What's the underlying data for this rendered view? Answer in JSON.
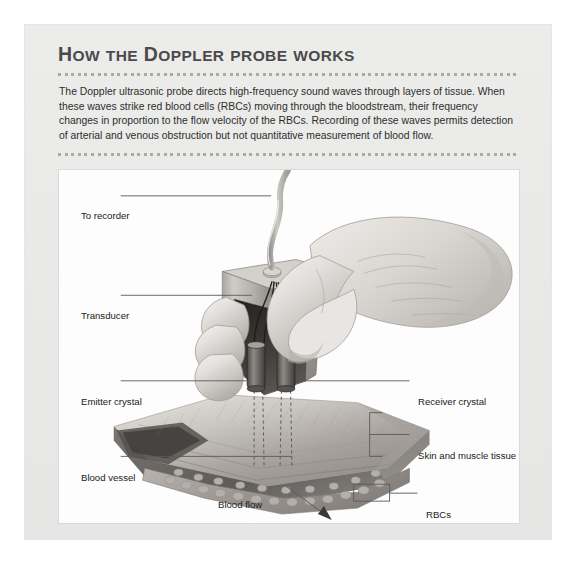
{
  "figure": {
    "title_word1": "How",
    "title_word2": "the",
    "title_word3": "Doppler",
    "title_word4": "probe",
    "title_word5": "works",
    "title_plain": "HOW THE DOPPLER PROBE WORKS",
    "body": "The Doppler ultrasonic probe directs high-frequency sound waves through layers of tissue. When these waves strike red blood cells (RBCs) moving through the bloodstream, their frequency changes in proportion to the flow velocity of the RBCs. Recording of these waves permits detection of arterial and venous obstruction but not quantitative measurement of blood flow."
  },
  "labels": {
    "to_recorder": "To recorder",
    "transducer": "Transducer",
    "emitter_crystal": "Emitter crystal",
    "receiver_crystal": "Receiver crystal",
    "skin_and_muscle": "Skin and muscle tissue",
    "blood_vessel": "Blood vessel",
    "blood_flow": "Blood flow",
    "rbcs": "RBCs"
  },
  "colors": {
    "panel_background": "#ebebea",
    "panel_border": "#9a9a99",
    "title_text": "#4a4a4a",
    "body_text": "#2d2d2d",
    "plate_background": "#fdfdfd",
    "leader_line": "#5a5a5a",
    "dotted_rule": "#a9a9a8"
  }
}
